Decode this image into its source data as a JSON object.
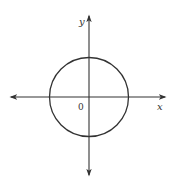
{
  "diagram": {
    "type": "coordinate-plane-with-circle",
    "axes": {
      "x_label": "x",
      "y_label": "y",
      "origin_label": "0",
      "color": "#333333"
    },
    "circle": {
      "center": [
        0,
        0
      ],
      "color": "#333333",
      "fill": "none"
    }
  }
}
